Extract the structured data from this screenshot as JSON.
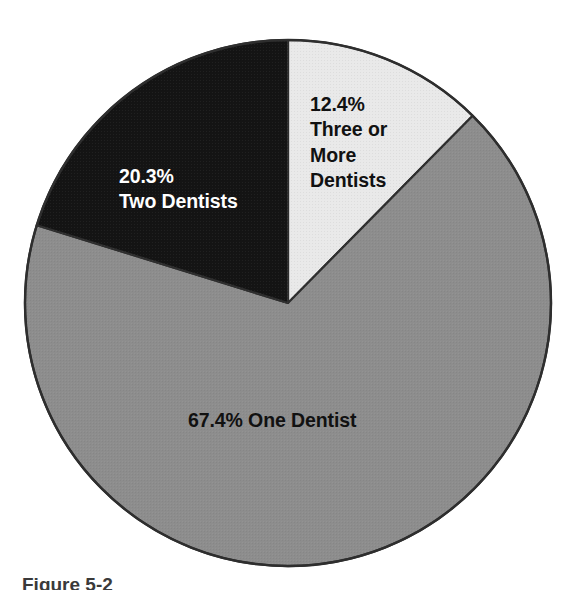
{
  "figure": {
    "caption": "Figure 5-2",
    "background_color": "#ffffff"
  },
  "chart_data": {
    "type": "pie",
    "title": "",
    "subtitle": "",
    "xlabel": "",
    "ylabel": "",
    "legend_position": "none",
    "grid": false,
    "units": "percent",
    "start_angle_deg": 0,
    "direction": "clockwise",
    "total": 100.1,
    "categories": [
      "Three or More Dentists",
      "One Dentist",
      "Two Dentists"
    ],
    "values": [
      12.4,
      67.4,
      20.3
    ],
    "slices": [
      {
        "name": "Three or More Dentists",
        "value": 12.4,
        "value_label": "12.4%",
        "label_text": "12.4%\nThree or\nMore\nDentists",
        "fill_color": "#e9e9e9",
        "stroke_color": "#2e2e2e",
        "text_color": "#111111",
        "start_angle_deg": 0,
        "end_angle_deg": 44.6
      },
      {
        "name": "One Dentist",
        "value": 67.4,
        "value_label": "67.4%",
        "label_text": "67.4% One Dentist",
        "fill_color": "#8d8d8d",
        "stroke_color": "#2e2e2e",
        "text_color": "#111111",
        "start_angle_deg": 44.6,
        "end_angle_deg": 287.2
      },
      {
        "name": "Two Dentists",
        "value": 20.3,
        "value_label": "20.3%",
        "label_text": "20.3%\nTwo Dentists",
        "fill_color": "#141414",
        "stroke_color": "#2e2e2e",
        "text_color": "#ffffff",
        "start_angle_deg": 287.2,
        "end_angle_deg": 360
      }
    ],
    "geometry": {
      "center_x": 288,
      "center_y": 303,
      "radius": 263
    }
  }
}
